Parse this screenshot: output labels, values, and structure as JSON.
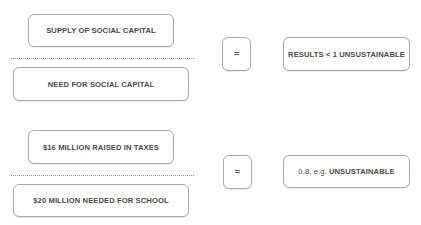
{
  "rows": [
    {
      "numerator": "SUPPLY OF SOCIAL CAPITAL",
      "denominator": "NEED FOR SOCIAL CAPITAL",
      "operator": "=",
      "result": "RESULTS < 1 UNSUSTAINABLE"
    },
    {
      "numerator": "$16 MILLION RAISED IN TAXES",
      "denominator": "$20 MILLION NEEDED FOR SCHOOL",
      "operator": "=",
      "result_prefix": "0.8, e.g.",
      "result_main": "UNSUSTAINABLE"
    }
  ],
  "colors": {
    "border": "#a9a9a9",
    "text": "#4a4a4a",
    "divider": "#9a9a9a",
    "background": "#ffffff"
  }
}
